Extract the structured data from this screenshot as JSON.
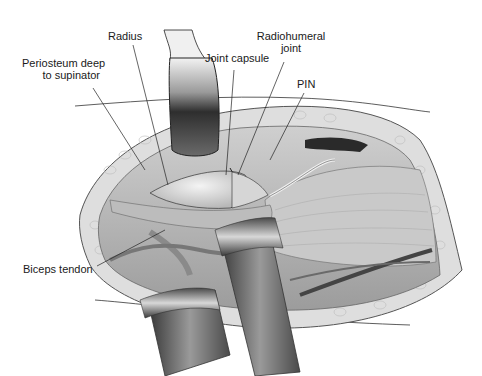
{
  "figure": {
    "labels": {
      "radius": "Radius",
      "periosteum_line1": "Periosteum deep",
      "periosteum_line2": "to supinator",
      "joint_capsule": "Joint capsule",
      "radiohumeral_line1": "Radiohumeral",
      "radiohumeral_line2": "joint",
      "pin": "PIN",
      "biceps_tendon": "Biceps tendon"
    },
    "colors": {
      "background": "#ffffff",
      "text": "#1a1a1a",
      "leader_line": "#222222",
      "skin_fat": "#d9d9d9",
      "tissue": "#bdbdbd",
      "retractor_dark": "#3a3a3a",
      "retractor_light": "#e6e6e6",
      "vessel": "#555555"
    }
  }
}
